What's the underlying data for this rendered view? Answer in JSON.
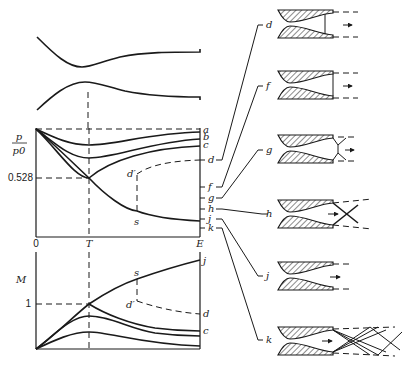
{
  "figure": {
    "colors": {
      "ink": "#1a1a1a",
      "background": "#ffffff"
    }
  },
  "pressure_plot": {
    "ylabel_num": "p",
    "ylabel_den": "p0",
    "critical_ratio_label": "0.528",
    "point_s": "s",
    "point_d_prime": "d′",
    "curve_labels": [
      "a",
      "b",
      "c",
      "d",
      "f",
      "g",
      "h",
      "j",
      "k"
    ]
  },
  "x_axis": {
    "start": "0",
    "throat": "T",
    "exit": "E"
  },
  "mach_plot": {
    "ylabel": "M",
    "sonic_label": "1",
    "point_s": "s",
    "point_d_prime": "d′",
    "curve_labels": {
      "j": "j",
      "d": "d",
      "c": "c"
    }
  },
  "nozzle_sketches": [
    {
      "label": "d",
      "regime": "normal shock inside diverging section"
    },
    {
      "label": "f",
      "regime": "normal shock at exit plane"
    },
    {
      "label": "g",
      "regime": "oblique shocks at exit (overexpanded)"
    },
    {
      "label": "h",
      "regime": "crossing oblique shocks (overexpanded)"
    },
    {
      "label": "j",
      "regime": "design condition"
    },
    {
      "label": "k",
      "regime": "expansion waves (underexpanded)"
    }
  ]
}
